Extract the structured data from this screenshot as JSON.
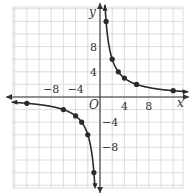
{
  "chart_data": {
    "type": "line",
    "title": "",
    "xlabel": "x",
    "ylabel": "y",
    "origin_label": "O",
    "xlim": [
      -14,
      14
    ],
    "ylim": [
      -14,
      14
    ],
    "grid": true,
    "grid_step": 2,
    "x_ticks": [
      {
        "value": -8,
        "label": "−8"
      },
      {
        "value": -4,
        "label": "−4"
      },
      {
        "value": 4,
        "label": "4"
      },
      {
        "value": 8,
        "label": "8"
      }
    ],
    "y_ticks": [
      {
        "value": 8,
        "label": "8"
      },
      {
        "value": 4,
        "label": "4"
      },
      {
        "value": -4,
        "label": "−4"
      },
      {
        "value": -8,
        "label": "−8"
      }
    ],
    "function": "y = 12/x",
    "series": [
      {
        "name": "positive branch",
        "points": [
          [
            1,
            12
          ],
          [
            2,
            6
          ],
          [
            3,
            4
          ],
          [
            4,
            3
          ],
          [
            6,
            2
          ],
          [
            12,
            1
          ]
        ]
      },
      {
        "name": "negative branch",
        "points": [
          [
            -12,
            -1
          ],
          [
            -6,
            -2
          ],
          [
            -4,
            -3
          ],
          [
            -3,
            -4
          ],
          [
            -2,
            -6
          ],
          [
            -1,
            -12
          ]
        ]
      }
    ],
    "colors": {
      "curve": "#2a2a2a",
      "grid": "#d4d4d4",
      "axis": "#333333"
    }
  }
}
